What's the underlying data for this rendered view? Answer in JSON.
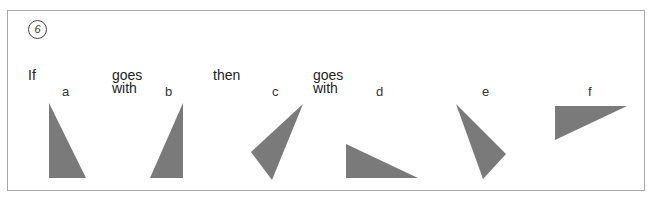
{
  "puzzle": {
    "number": "6",
    "words": {
      "if": "If",
      "goes1": "goes",
      "with1": "with",
      "then": "then",
      "goes2": "goes",
      "with2": "with"
    },
    "labels": [
      "a",
      "b",
      "c",
      "d",
      "e",
      "f"
    ],
    "shape_color": "#7a7a7a",
    "shapes": [
      {
        "label": "a",
        "points": "49,103 49,178 86,178"
      },
      {
        "label": "b",
        "points": "183,103 183,178 150,178"
      },
      {
        "label": "c",
        "points": "303,104 251,152 272,180"
      },
      {
        "label": "d",
        "points": "346,144 346,178 418,178"
      },
      {
        "label": "e",
        "points": "456,104 506,154 483,179"
      },
      {
        "label": "f",
        "points": "555,106 555,140 627,106"
      }
    ]
  }
}
